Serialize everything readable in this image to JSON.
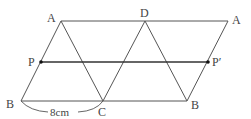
{
  "diagram": {
    "type": "geometry-figure",
    "points": {
      "A": {
        "label": "A",
        "x": 61,
        "y": 21
      },
      "D": {
        "label": "D",
        "x": 145,
        "y": 21
      },
      "A2": {
        "label": "A",
        "x": 228,
        "y": 21
      },
      "P": {
        "label": "P",
        "x": 41,
        "y": 62
      },
      "P2": {
        "label": "P′",
        "x": 208,
        "y": 62
      },
      "B": {
        "label": "B",
        "x": 21,
        "y": 101
      },
      "C": {
        "label": "C",
        "x": 103,
        "y": 101
      },
      "B2": {
        "label": "B",
        "x": 187,
        "y": 101
      }
    },
    "measurement": {
      "label": "8cm",
      "from": "B",
      "to": "C"
    },
    "colors": {
      "line": "#555555",
      "bold_line": "#333333",
      "text": "#444444",
      "point": "#111111",
      "background": "#ffffff"
    }
  }
}
